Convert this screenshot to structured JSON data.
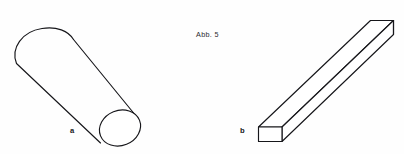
{
  "figure": {
    "caption": "Abb. 5",
    "background_color": "#fefefe",
    "stroke_color": "#16161a",
    "fill_color": "#ffffff",
    "width": 404,
    "height": 154,
    "parts": [
      {
        "id": "a",
        "label": "a",
        "shape": "cylinder",
        "description": "cylindrical rod drawn in oblique projection, rounded far cap upper-left, elliptical near end face lower-right"
      },
      {
        "id": "b",
        "label": "b",
        "shape": "rectangular-bar",
        "description": "rectangular prism bar drawn in oblique projection, square near end face lower-left, far end upper-right"
      }
    ]
  },
  "cylinder": {
    "top_cap_path": "M 16.5 63.5 C 10.5 48.0 22.0 31.5 42.0 28.5 C 56.5 26.0 68.5 31.0 73.5 39.5",
    "body_upper_edge": "M 73.5 39.5 L 138.5 119.0",
    "body_lower_edge": "M 16.5 63.5 L 100.5 143.0",
    "near_face_ellipse": {
      "cx": 120.0,
      "cy": 128.0,
      "rx": 21.0,
      "ry": 17.5,
      "rotation": -22
    }
  },
  "bar": {
    "near_face_path": "M 258.5 127.0 L 282.0 127.0 L 282.0 141.5 L 258.5 141.5 Z",
    "top_face_path": "M 258.5 127.0 L 370.5 20.5 L 393.5 20.5 L 282.0 127.0 Z",
    "side_face_path": "M 282.0 127.0 L 393.5 20.5 L 393.5 34.5 L 282.0 141.5 Z",
    "far_vertical_edge": "M 393.5 20.5 L 393.5 34.5"
  }
}
